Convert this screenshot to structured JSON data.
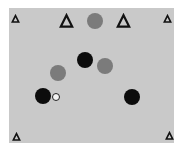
{
  "scene": {
    "background_color": "#ffffff",
    "board_color": "#c9c9c9",
    "board": {
      "x": 9,
      "y": 8,
      "width": 165,
      "height": 135
    }
  },
  "markers": [
    {
      "id": "corner-top-left",
      "shape": "triangle-outline",
      "size": "small",
      "x": 15,
      "y": 18
    },
    {
      "id": "top-left-large",
      "shape": "triangle-outline",
      "size": "large",
      "x": 66,
      "y": 20
    },
    {
      "id": "top-right-large",
      "shape": "triangle-outline",
      "size": "large",
      "x": 123,
      "y": 20
    },
    {
      "id": "corner-top-right",
      "shape": "triangle-outline",
      "size": "small",
      "x": 167,
      "y": 18
    },
    {
      "id": "corner-bottom-left",
      "shape": "triangle-outline",
      "size": "small",
      "x": 16,
      "y": 136
    },
    {
      "id": "corner-bottom-right",
      "shape": "triangle-outline",
      "size": "small",
      "x": 169,
      "y": 135
    }
  ],
  "pieces": [
    {
      "id": "gray-top",
      "color": "gray",
      "hex": "#7b7b7b",
      "x": 95,
      "y": 21,
      "r": 8
    },
    {
      "id": "black-center",
      "color": "black",
      "hex": "#0c0c0c",
      "x": 85,
      "y": 60,
      "r": 8
    },
    {
      "id": "gray-right",
      "color": "gray",
      "hex": "#7b7b7b",
      "x": 105,
      "y": 66,
      "r": 8
    },
    {
      "id": "gray-left",
      "color": "gray",
      "hex": "#7b7b7b",
      "x": 58,
      "y": 73,
      "r": 8
    },
    {
      "id": "black-left",
      "color": "black",
      "hex": "#0c0c0c",
      "x": 43,
      "y": 96,
      "r": 8
    },
    {
      "id": "white-ball",
      "color": "white",
      "hex": "#f4f4f4",
      "x": 56,
      "y": 97,
      "r": 4
    },
    {
      "id": "black-right",
      "color": "black",
      "hex": "#0c0c0c",
      "x": 132,
      "y": 97,
      "r": 8
    }
  ]
}
